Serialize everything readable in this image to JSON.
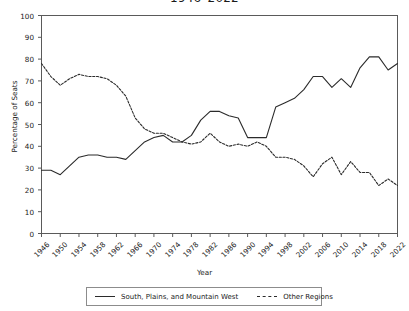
{
  "chart_data": {
    "type": "line",
    "title": "1946–2022",
    "xlabel": "Year",
    "ylabel": "Percentage of Seats",
    "xlim": [
      1946,
      2022
    ],
    "ylim": [
      0,
      100
    ],
    "grid": false,
    "legend_position": "bottom",
    "yticks": [
      0,
      10,
      20,
      30,
      40,
      50,
      60,
      70,
      80,
      90,
      100
    ],
    "xticks": [
      1946,
      1950,
      1954,
      1958,
      1962,
      1966,
      1970,
      1974,
      1978,
      1982,
      1986,
      1990,
      1994,
      1998,
      2002,
      2006,
      2010,
      2014,
      2018,
      2022
    ],
    "x": [
      1946,
      1948,
      1950,
      1952,
      1954,
      1956,
      1958,
      1960,
      1962,
      1964,
      1966,
      1968,
      1970,
      1972,
      1974,
      1976,
      1978,
      1980,
      1982,
      1984,
      1986,
      1988,
      1990,
      1992,
      1994,
      1996,
      1998,
      2000,
      2002,
      2004,
      2006,
      2008,
      2010,
      2012,
      2014,
      2016,
      2018,
      2020,
      2022
    ],
    "series": [
      {
        "name": "South, Plains, and Mountain West",
        "style": "solid",
        "color": "#2b2b2b",
        "values": [
          29,
          29,
          27,
          31,
          35,
          36,
          36,
          35,
          35,
          34,
          38,
          42,
          44,
          45,
          42,
          42,
          45,
          52,
          56,
          56,
          54,
          53,
          44,
          44,
          44,
          58,
          60,
          62,
          66,
          72,
          72,
          67,
          71,
          67,
          76,
          81,
          81,
          75,
          78
        ]
      },
      {
        "name": "Other Regions",
        "style": "dashed",
        "color": "#2b2b2b",
        "values": [
          78,
          72,
          68,
          71,
          73,
          72,
          72,
          71,
          68,
          63,
          53,
          48,
          46,
          46,
          44,
          42,
          41,
          42,
          46,
          42,
          40,
          41,
          40,
          42,
          40,
          35,
          35,
          34,
          31,
          26,
          32,
          35,
          27,
          33,
          28,
          28,
          22,
          25,
          22
        ]
      }
    ]
  }
}
